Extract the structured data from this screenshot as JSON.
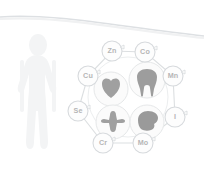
{
  "figure": {
    "background_color": "#ffffff",
    "line_color": "#d9dcdf",
    "label_color": "#b6b6b6",
    "icon_color": "#9a9a9a",
    "silhouette_color": "#f2f3f4"
  },
  "decor": {
    "top_curve_name": "top-curve-line",
    "silhouette_name": "human-body-silhouette"
  },
  "ring": {
    "nodes": [
      {
        "label": "Zn",
        "name": "element-node-zn",
        "cx": 112,
        "cy": 51
      },
      {
        "label": "Co",
        "name": "element-node-co",
        "cx": 145,
        "cy": 52
      },
      {
        "label": "Mn",
        "name": "element-node-mn",
        "cx": 173,
        "cy": 76
      },
      {
        "label": "I",
        "name": "element-node-i",
        "cx": 175,
        "cy": 117
      },
      {
        "label": "Mo",
        "name": "element-node-mo",
        "cx": 143,
        "cy": 143
      },
      {
        "label": "Cr",
        "name": "element-node-cr",
        "cx": 103,
        "cy": 143
      },
      {
        "label": "Se",
        "name": "element-node-se",
        "cx": 78,
        "cy": 111
      },
      {
        "label": "Cu",
        "name": "element-node-cu",
        "cx": 88,
        "cy": 76
      }
    ]
  },
  "organs": [
    {
      "icon": "heart-icon",
      "name": "organ-circle-heart",
      "cx": 111,
      "cy": 89
    },
    {
      "icon": "tooth-icon",
      "name": "organ-circle-tooth",
      "cx": 147,
      "cy": 80
    },
    {
      "icon": "bone-joint-icon",
      "name": "organ-circle-bone",
      "cx": 113,
      "cy": 122
    },
    {
      "icon": "brain-icon",
      "name": "organ-circle-brain",
      "cx": 147,
      "cy": 122
    }
  ]
}
